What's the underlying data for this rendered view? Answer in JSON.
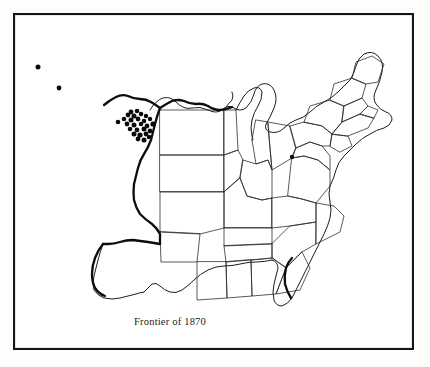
{
  "figure": {
    "kind": "historical-map",
    "background_color": "#ffffff",
    "ink_color": "#1d1d1d",
    "frame": {
      "x": 13,
      "y": 13,
      "width": 401,
      "height": 337,
      "stroke_color": "#161616",
      "stroke_width": 2.1
    }
  },
  "caption": {
    "text": "Frontier of 1870",
    "x": 134,
    "y": 316,
    "font_size_px": 10.5,
    "color": "#222222"
  },
  "legend_features": [
    {
      "name": "frontier-line",
      "label": "Frontier of 1870",
      "style": "heavy solid line",
      "stroke_color": "#0d0d0d",
      "stroke_width": 2.3
    },
    {
      "name": "state-borders",
      "label": "State boundaries",
      "style": "thin solid line",
      "stroke_color": "#2b2b2b",
      "stroke_width": 0.78
    },
    {
      "name": "site-dots",
      "label": "Site markers",
      "style": "filled circles",
      "fill_color": "#0a0a0a"
    }
  ],
  "chart_data": {
    "type": "scatter",
    "title": "Frontier of 1870",
    "xlabel": "",
    "ylabel": "",
    "grid": false,
    "legend_position": "none",
    "series": [
      {
        "name": "outlier-sites-west",
        "count": 2,
        "points": [
          {
            "x": 38,
            "y": 67,
            "r": 2.5
          },
          {
            "x": 59,
            "y": 88,
            "r": 2.4
          }
        ]
      },
      {
        "name": "isolated-site-west-of-cluster",
        "count": 1,
        "points": [
          {
            "x": 118,
            "y": 122,
            "r": 2.3
          }
        ]
      },
      {
        "name": "main-cluster-central-plains",
        "count": 26,
        "points": [
          {
            "x": 131,
            "y": 112,
            "r": 2.4
          },
          {
            "x": 137,
            "y": 111,
            "r": 2.3
          },
          {
            "x": 128,
            "y": 115,
            "r": 2.4
          },
          {
            "x": 134,
            "y": 116,
            "r": 2.5
          },
          {
            "x": 141,
            "y": 114,
            "r": 2.3
          },
          {
            "x": 146,
            "y": 116,
            "r": 2.2
          },
          {
            "x": 124,
            "y": 119,
            "r": 2.3
          },
          {
            "x": 131,
            "y": 120,
            "r": 2.5
          },
          {
            "x": 138,
            "y": 119,
            "r": 2.4
          },
          {
            "x": 144,
            "y": 121,
            "r": 2.3
          },
          {
            "x": 150,
            "y": 119,
            "r": 2.2
          },
          {
            "x": 127,
            "y": 124,
            "r": 2.4
          },
          {
            "x": 134,
            "y": 125,
            "r": 2.5
          },
          {
            "x": 141,
            "y": 124,
            "r": 2.3
          },
          {
            "x": 147,
            "y": 126,
            "r": 2.4
          },
          {
            "x": 153,
            "y": 124,
            "r": 2.6
          },
          {
            "x": 130,
            "y": 129,
            "r": 2.3
          },
          {
            "x": 137,
            "y": 130,
            "r": 2.4
          },
          {
            "x": 144,
            "y": 129,
            "r": 2.5
          },
          {
            "x": 150,
            "y": 131,
            "r": 2.4
          },
          {
            "x": 134,
            "y": 134,
            "r": 2.5
          },
          {
            "x": 140,
            "y": 135,
            "r": 2.6
          },
          {
            "x": 146,
            "y": 134,
            "r": 2.4
          },
          {
            "x": 138,
            "y": 139,
            "r": 2.4
          },
          {
            "x": 144,
            "y": 140,
            "r": 2.5
          },
          {
            "x": 149,
            "y": 137,
            "r": 2.3
          }
        ]
      },
      {
        "name": "eastern-site-ohio-pennsylvania",
        "count": 1,
        "points": [
          {
            "x": 292,
            "y": 157,
            "r": 2.2
          }
        ]
      }
    ]
  }
}
